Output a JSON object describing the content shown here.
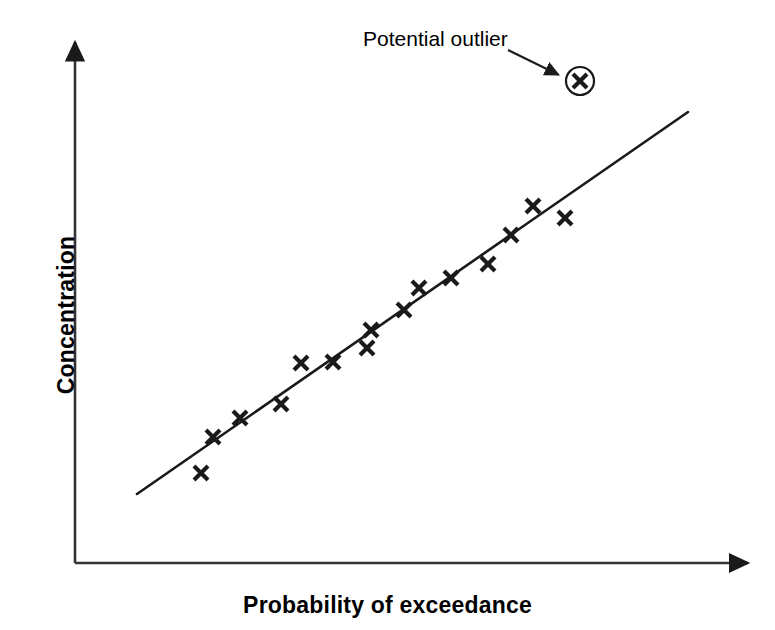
{
  "figure": {
    "background": "#ffffff",
    "ink_color": "#1a1a1a",
    "width": 775,
    "height": 630
  },
  "annotation": {
    "label": "Potential outlier",
    "arrow_from": [
      508,
      50
    ],
    "arrow_to": [
      563,
      77
    ],
    "circle_center": [
      580,
      81
    ],
    "circle_radius": 14
  },
  "axes": {
    "origin": [
      75,
      563
    ],
    "y_axis_top": [
      75,
      35
    ],
    "x_axis_right": [
      755,
      563
    ],
    "x_label": "Probability of exceedance",
    "y_label": "Concentration"
  },
  "chart_data": {
    "type": "scatter",
    "title": "",
    "xlabel": "Probability of exceedance",
    "ylabel": "Concentration",
    "xlim": [
      0,
      1
    ],
    "ylim": [
      0,
      1
    ],
    "grid": false,
    "legend": "none",
    "axis_ticks": "none",
    "marker": "x",
    "marker_color": "#1a1a1a",
    "series": [
      {
        "name": "Observations",
        "marker": "x",
        "points": [
          [
            201,
            473
          ],
          [
            213,
            437
          ],
          [
            240,
            418
          ],
          [
            281,
            404
          ],
          [
            301,
            363
          ],
          [
            333,
            362
          ],
          [
            367,
            348
          ],
          [
            371,
            330
          ],
          [
            404,
            310
          ],
          [
            419,
            288
          ],
          [
            451,
            278
          ],
          [
            488,
            264
          ],
          [
            511,
            235
          ],
          [
            533,
            206
          ],
          [
            565,
            218
          ]
        ]
      },
      {
        "name": "Potential outlier",
        "marker": "x-circled",
        "points": [
          [
            580,
            81
          ]
        ]
      }
    ],
    "trend_line": {
      "name": "Fitted line",
      "start": [
        137,
        494
      ],
      "end": [
        688,
        112
      ],
      "color": "#1a1a1a"
    },
    "annotations": [
      {
        "text": "Potential outlier",
        "anchor": [
          363,
          27
        ],
        "points_to": [
          563,
          77
        ]
      }
    ]
  }
}
